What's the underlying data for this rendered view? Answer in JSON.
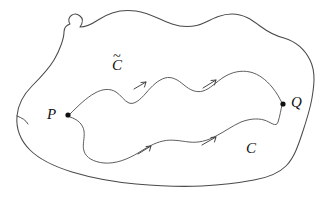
{
  "figure": {
    "domain_label": "Diagram",
    "background_color": "#ffffff",
    "outline_color": "#4a4a4a",
    "curve_color": "#555555",
    "label_color": "#101010",
    "width": 324,
    "height": 201
  },
  "labels": {
    "point_p": "P",
    "point_q": "Q",
    "curve_lower": "C",
    "curve_upper_base": "C",
    "curve_upper_accent": "~"
  },
  "points": [
    {
      "name": "P",
      "label": "P",
      "x": 68,
      "y": 115,
      "radius": 2.6
    },
    {
      "name": "Q",
      "label": "Q",
      "x": 283,
      "y": 104,
      "radius": 2.6
    }
  ],
  "curves": [
    {
      "name": "C-tilde",
      "label": "C̃",
      "description": "upper path from P to Q",
      "from": "P",
      "to": "Q",
      "arrow_count": 2
    },
    {
      "name": "C",
      "label": "C",
      "description": "lower path from P to Q",
      "from": "P",
      "to": "Q",
      "arrow_count": 2
    }
  ],
  "arrow_markers": [
    {
      "name": "arrow-upper-left",
      "x": 142,
      "y": 80,
      "direction": "right-up"
    },
    {
      "name": "arrow-upper-right",
      "x": 212,
      "y": 81,
      "direction": "right-up"
    },
    {
      "name": "arrow-lower-left",
      "x": 150,
      "y": 146,
      "direction": "right-up"
    },
    {
      "name": "arrow-lower-right",
      "x": 213,
      "y": 140,
      "direction": "right-up"
    }
  ],
  "region": {
    "name": "simply-connected-region",
    "closed": true,
    "stroke": "#4a4a4a"
  }
}
